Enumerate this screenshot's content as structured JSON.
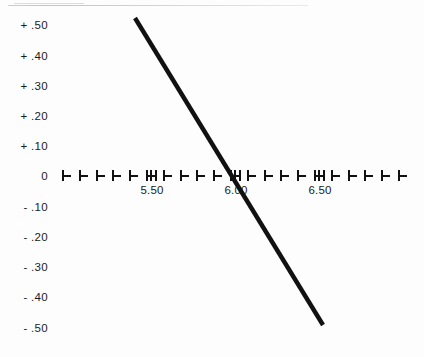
{
  "chart_data": {
    "type": "line",
    "title": "",
    "subtitle": "",
    "xlabel": "",
    "ylabel": "",
    "grid": false,
    "legend": false,
    "xlim": [
      5.2,
      6.92
    ],
    "ylim": [
      -0.5,
      0.5
    ],
    "x_major_ticks": [
      5.5,
      6.0,
      6.5
    ],
    "x_major_tick_labels": [
      "5.50",
      "6.00",
      "6.50"
    ],
    "x_minor_tick_step": 0.1,
    "y_ticks": [
      0.5,
      0.4,
      0.3,
      0.2,
      0.1,
      0.0,
      -0.1,
      -0.2,
      -0.3,
      -0.4,
      -0.5
    ],
    "y_tick_labels": [
      "+ .50",
      "+ .40",
      "+ .30",
      "+ .20",
      "+ .10",
      "0",
      "- .10",
      "- .20",
      "- .30",
      "- .40",
      "- .50"
    ],
    "series": [
      {
        "name": "trend-line",
        "color": "#111111",
        "width": 4.4,
        "x": [
          5.68,
          6.0,
          6.77
        ],
        "y": [
          0.495,
          0.0,
          -0.478
        ]
      }
    ],
    "zero_crossing_x": 6.0,
    "annotations": []
  },
  "axes": {
    "y_labels": [
      {
        "text": "+ .50",
        "y": 25
      },
      {
        "text": "+ .40",
        "y": 56
      },
      {
        "text": "+ .30",
        "y": 86
      },
      {
        "text": "+ .20",
        "y": 116
      },
      {
        "text": "+ .10",
        "y": 146
      },
      {
        "text": "0",
        "y": 176
      },
      {
        "text": "- .10",
        "y": 207
      },
      {
        "text": "- .20",
        "y": 237
      },
      {
        "text": "- .30",
        "y": 267
      },
      {
        "text": "- .40",
        "y": 297
      },
      {
        "text": "- .50",
        "y": 328
      }
    ],
    "x_labels": [
      {
        "text": "5.50",
        "x": 152
      },
      {
        "text": "6.00",
        "x": 236
      },
      {
        "text": "6.50",
        "x": 320
      }
    ],
    "axis_y_px": 176,
    "axis_start_px": 62,
    "axis_end_px": 412,
    "minor_step_px": 16.8,
    "major_positions_px": [
      152,
      236,
      320
    ]
  },
  "line": {
    "x1": 135,
    "y1": 18,
    "x2": 323,
    "y2": 325,
    "color": "#111111",
    "stroke_width": 4.4
  },
  "colors": {
    "background": "#fdfdfd",
    "ink": "#1b1b1b",
    "line": "#111111",
    "artifact": "#c9c9c9"
  }
}
